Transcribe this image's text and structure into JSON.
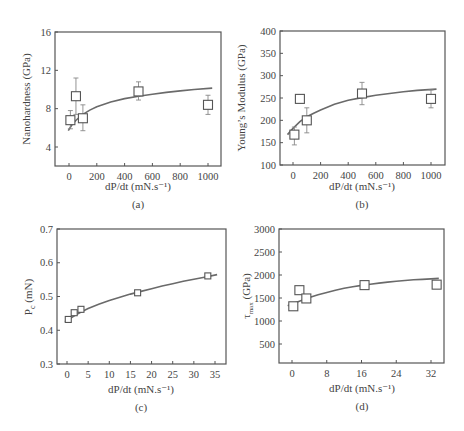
{
  "chart_data": [
    {
      "id": "a",
      "type": "scatter",
      "caption": "(a)",
      "title": "",
      "xlabel": "dP/dt (mN.s⁻¹)",
      "ylabel": "Nanohardness (GPa)",
      "xlim": [
        -100,
        1100
      ],
      "ylim": [
        2,
        16
      ],
      "xticks": [
        0,
        200,
        400,
        600,
        800,
        1000
      ],
      "yticks": [
        4,
        8,
        12,
        16
      ],
      "grid": false,
      "legend": null,
      "frame": {
        "x0": 55,
        "y0": 32,
        "x1": 221,
        "y1": 166
      },
      "xmap": {
        "v0": 0,
        "p0": 69,
        "v1": 1000,
        "p1": 208
      },
      "ymap": {
        "v0": 16,
        "p0": 32,
        "v1": 4,
        "p1": 147
      },
      "series": [
        {
          "name": "Measured",
          "marker": "square",
          "x": [
            10,
            50,
            100,
            500,
            1000
          ],
          "y": [
            6.8,
            9.3,
            7.0,
            9.8,
            8.4
          ],
          "err_low": [
            5.9,
            7.4,
            5.7,
            8.9,
            7.4
          ],
          "err_high": [
            7.8,
            11.2,
            8.4,
            10.8,
            9.4
          ]
        }
      ],
      "fit": {
        "name": "Fit",
        "x": [
          -5,
          20,
          50,
          100,
          150,
          200,
          300,
          400,
          500,
          600,
          700,
          800,
          900,
          1030
        ],
        "y": [
          5.7,
          6.3,
          6.8,
          7.4,
          7.85,
          8.2,
          8.7,
          9.05,
          9.3,
          9.5,
          9.7,
          9.85,
          10.0,
          10.15
        ]
      }
    },
    {
      "id": "b",
      "type": "scatter",
      "caption": "(b)",
      "title": "",
      "xlabel": "dP/dt (mN.s⁻¹)",
      "ylabel": "Young’s Modulus (GPa)",
      "xlim": [
        -100,
        1100
      ],
      "ylim": [
        100,
        400
      ],
      "xticks": [
        0,
        200,
        400,
        600,
        800,
        1000
      ],
      "yticks": [
        100,
        150,
        200,
        250,
        300,
        350,
        400
      ],
      "grid": false,
      "legend": null,
      "frame": {
        "x0": 280,
        "y0": 31,
        "x1": 445,
        "y1": 165
      },
      "xmap": {
        "v0": 0,
        "p0": 293,
        "v1": 1000,
        "p1": 431
      },
      "ymap": {
        "v0": 400,
        "p0": 31,
        "v1": 100,
        "p1": 165
      },
      "series": [
        {
          "name": "Measured",
          "marker": "square",
          "x": [
            10,
            50,
            100,
            500,
            1000
          ],
          "y": [
            168,
            248,
            200,
            260,
            248
          ],
          "err_low": [
            145,
            248,
            172,
            235,
            228
          ],
          "err_high": [
            185,
            248,
            228,
            285,
            268
          ]
        }
      ],
      "fit": {
        "name": "Fit",
        "x": [
          -40,
          0,
          50,
          100,
          150,
          200,
          300,
          400,
          500,
          600,
          700,
          800,
          900,
          1040
        ],
        "y": [
          168,
          182,
          197,
          208,
          216,
          223,
          236,
          245,
          251,
          256,
          260,
          264,
          267,
          270
        ]
      }
    },
    {
      "id": "c",
      "type": "scatter",
      "caption": "(c)",
      "title": "",
      "xlabel": "dP/dt (mN.s⁻¹)",
      "ylabel": "P_c (mN)",
      "xlim": [
        -2.5,
        37.5
      ],
      "ylim": [
        0.3,
        0.7
      ],
      "xticks": [
        0,
        5,
        10,
        15,
        20,
        25,
        30,
        35
      ],
      "yticks": [
        0.3,
        0.4,
        0.5,
        0.6,
        0.7
      ],
      "grid": false,
      "legend": null,
      "frame": {
        "x0": 57,
        "y0": 229,
        "x1": 226,
        "y1": 364
      },
      "xmap": {
        "v0": 0,
        "p0": 67,
        "v1": 35,
        "p1": 215
      },
      "ymap": {
        "v0": 0.7,
        "p0": 229,
        "v1": 0.3,
        "p1": 364
      },
      "series": [
        {
          "name": "Measured",
          "marker": "square",
          "x": [
            0.3,
            1.7,
            3.3,
            16.7,
            33.3
          ],
          "y": [
            0.432,
            0.452,
            0.462,
            0.511,
            0.561
          ],
          "err_low": [],
          "err_high": []
        }
      ],
      "fit": {
        "name": "Fit",
        "x": [
          -0.5,
          1,
          2,
          3,
          5,
          7.5,
          10,
          12.5,
          15,
          17.5,
          20,
          22.5,
          25,
          27.5,
          30,
          32.5,
          35.5
        ],
        "y": [
          0.425,
          0.437,
          0.445,
          0.452,
          0.464,
          0.477,
          0.488,
          0.498,
          0.507,
          0.515,
          0.523,
          0.531,
          0.538,
          0.545,
          0.551,
          0.557,
          0.565
        ]
      }
    },
    {
      "id": "d",
      "type": "scatter",
      "caption": "(d)",
      "title": "",
      "xlabel": "dP/dt (mN.s⁻¹)",
      "ylabel": "τmax (GPa)",
      "xlim": [
        -4,
        36
      ],
      "ylim": [
        90,
        3000
      ],
      "xticks": [
        0,
        8,
        16,
        24,
        32
      ],
      "yticks": [
        500,
        1000,
        1500,
        2000,
        2500,
        3000
      ],
      "grid": false,
      "legend": null,
      "frame": {
        "x0": 279,
        "y0": 229,
        "x1": 444,
        "y1": 363
      },
      "xmap": {
        "v0": 0,
        "p0": 292,
        "v1": 32,
        "p1": 431
      },
      "ymap": {
        "v0": 3000,
        "p0": 229,
        "v1": 500,
        "p1": 344
      },
      "series": [
        {
          "name": "Measured",
          "marker": "square",
          "x": [
            0.3,
            1.7,
            3.3,
            16.7,
            33.3
          ],
          "y": [
            1320,
            1670,
            1490,
            1780,
            1790
          ],
          "err_low": [],
          "err_high": []
        }
      ],
      "fit": {
        "name": "Fit",
        "x": [
          -1,
          0,
          2,
          4,
          6,
          8,
          10,
          12,
          14,
          16,
          18,
          20,
          22,
          24,
          26,
          28,
          30,
          32,
          33.8
        ],
        "y": [
          1330,
          1370,
          1440,
          1510,
          1570,
          1620,
          1670,
          1710,
          1745,
          1775,
          1800,
          1825,
          1845,
          1865,
          1880,
          1895,
          1905,
          1915,
          1925
        ]
      }
    }
  ],
  "panels": {
    "a": {
      "caption": "(a)",
      "xlabel": "dP/dt (mN.s⁻¹)",
      "ylabel": "Nanohardness (GPa)"
    },
    "b": {
      "caption": "(b)",
      "xlabel": "dP/dt (mN.s⁻¹)",
      "ylabel": "Young’s Modulus (GPa)"
    },
    "c": {
      "caption": "(c)",
      "xlabel": "dP/dt (mN.s⁻¹)",
      "ylabel_main": "P",
      "ylabel_sub": "c",
      "ylabel_unit": " (mN)"
    },
    "d": {
      "caption": "(d)",
      "xlabel": "dP/dt (mN.s⁻¹)",
      "ylabel_main": "τ",
      "ylabel_sub": "max",
      "ylabel_unit": " (GPa)"
    }
  },
  "colors": {
    "frame": "#555555",
    "curve": "#6a6a6a",
    "marker_stroke": "#555555",
    "errorbar": "#888888"
  }
}
